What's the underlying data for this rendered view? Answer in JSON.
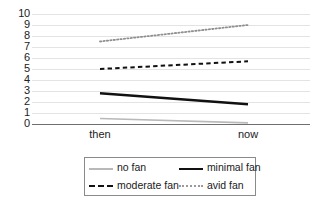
{
  "chart_data": {
    "type": "line",
    "title": "",
    "xlabel": "",
    "ylabel": "",
    "categories": [
      "then",
      "now"
    ],
    "x": [
      0,
      1
    ],
    "ylim": [
      0,
      10
    ],
    "yticks": [
      0,
      1,
      2,
      3,
      4,
      5,
      6,
      7,
      8,
      9,
      10
    ],
    "ytick_labels": [
      "0",
      "1",
      "2",
      "3",
      "4",
      "5",
      "6",
      "7",
      "8",
      "9",
      "10"
    ],
    "grid": true,
    "grid_axis": "y",
    "legend_position": "bottom",
    "series": [
      {
        "name": "no fan",
        "values": [
          0.5,
          0.1
        ],
        "style": "solid",
        "color": "#b9b9b9",
        "width": 1.6
      },
      {
        "name": "minimal fan",
        "values": [
          2.8,
          1.8
        ],
        "style": "solid",
        "color": "#111111",
        "width": 2.4
      },
      {
        "name": "moderate fan",
        "values": [
          5.0,
          5.7
        ],
        "style": "dashed",
        "color": "#111111",
        "width": 2.0
      },
      {
        "name": "avid fan",
        "values": [
          7.5,
          9.0
        ],
        "style": "dotted",
        "color": "#8f8f8f",
        "width": 1.8
      }
    ]
  },
  "legend": {
    "entries": [
      {
        "label": "no fan",
        "swatch": "solid-light"
      },
      {
        "label": "minimal fan",
        "swatch": "solid-dark"
      },
      {
        "label": "moderate fan",
        "swatch": "dashed"
      },
      {
        "label": "avid fan",
        "swatch": "dotted"
      }
    ]
  }
}
